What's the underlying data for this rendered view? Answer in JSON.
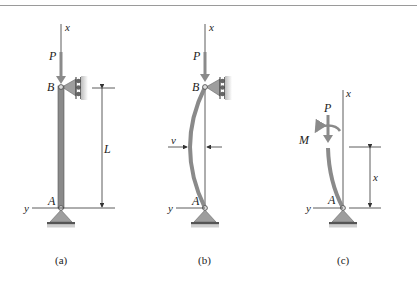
{
  "figure": {
    "panels": [
      {
        "id": "a",
        "caption": "(a)",
        "labels": {
          "axis_x": "x",
          "axis_y": "y",
          "load": "P",
          "top_point": "B",
          "bottom_point": "A",
          "length": "L"
        },
        "state": "undeflected pinned column"
      },
      {
        "id": "b",
        "caption": "(b)",
        "labels": {
          "axis_x": "x",
          "axis_y": "y",
          "load": "P",
          "top_point": "B",
          "bottom_point": "A",
          "deflection": "v"
        },
        "state": "buckled column"
      },
      {
        "id": "c",
        "caption": "(c)",
        "labels": {
          "axis_x": "x",
          "axis_y": "y",
          "load": "P",
          "moment": "M",
          "bottom_point": "A",
          "section_height": "x"
        },
        "state": "free-body diagram of column segment"
      }
    ],
    "colors": {
      "member": "#8a8a8a",
      "member_edge": "#555555",
      "support": "#9e9e9e",
      "ground": "#555555",
      "line": "#333333",
      "rule": "#9a9a9a"
    }
  }
}
